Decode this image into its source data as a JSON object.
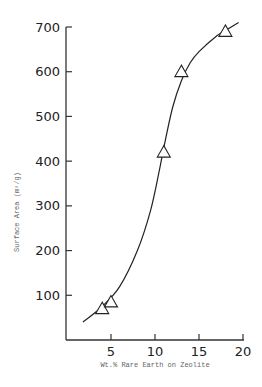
{
  "chart_data": {
    "type": "scatter",
    "title": "",
    "xlabel": "Wt.% Rare Earth on Zeolite",
    "ylabel": "Surface Area (m²/g)",
    "xlim": [
      0,
      20
    ],
    "ylim": [
      0,
      700
    ],
    "x_ticks": [
      5,
      10,
      15,
      20
    ],
    "y_ticks": [
      100,
      200,
      300,
      400,
      500,
      600,
      700
    ],
    "grid": false,
    "legend": "none",
    "marker": "open-triangle",
    "points": [
      {
        "x": 4,
        "y": 70
      },
      {
        "x": 5,
        "y": 85
      },
      {
        "x": 11,
        "y": 420
      },
      {
        "x": 13,
        "y": 600
      },
      {
        "x": 18,
        "y": 690
      }
    ],
    "fit_curve": {
      "description": "smooth sigmoidal curve through the data",
      "x": [
        1.8,
        4,
        6,
        8,
        9.5,
        10.5,
        11,
        12,
        13,
        14,
        15,
        17,
        18,
        19.5
      ],
      "y": [
        40,
        75,
        120,
        200,
        290,
        380,
        430,
        520,
        580,
        620,
        645,
        680,
        692,
        710
      ]
    }
  },
  "axes": {
    "xlabel": "Wt.% Rare Earth on Zeolite",
    "ylabel": "Surface Area (m²/g)",
    "x_tick_labels": [
      "5",
      "10",
      "15",
      "20"
    ],
    "y_tick_labels": [
      "100",
      "200",
      "300",
      "400",
      "500",
      "600",
      "700"
    ]
  }
}
